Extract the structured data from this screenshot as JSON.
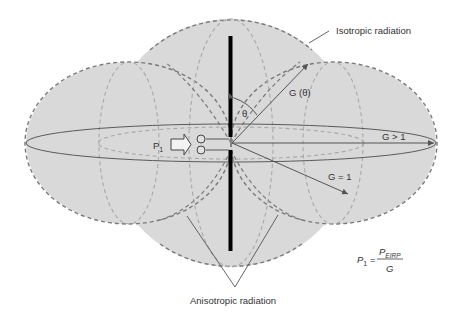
{
  "diagram": {
    "labels": {
      "isotropic": "Isotropic radiation",
      "anisotropic": "Anisotropic radiation",
      "g_theta": "G (θ)",
      "theta": "θ",
      "g_gt1": "G > 1",
      "g_eq1": "G = 1",
      "p1": "P",
      "p1_sub": "1"
    },
    "formula": {
      "lhs": "P",
      "lhs_sub": "1",
      "equals": "=",
      "numerator": "P",
      "numerator_sub": "EIRP",
      "denominator": "G"
    },
    "colors": {
      "fill": "#d9d9d9",
      "dashed_outline": "#7a7a7a",
      "light_dashed": "#a8a8a8",
      "line": "#5a5a5a",
      "antenna": "#000000",
      "text": "#333333"
    }
  }
}
